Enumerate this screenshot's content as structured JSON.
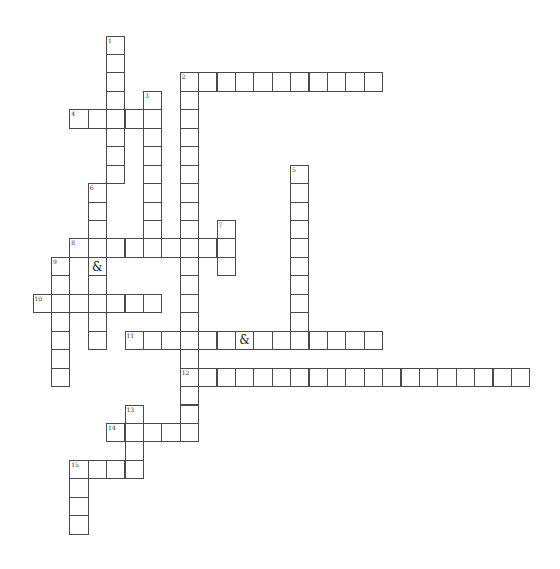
{
  "puzzle": {
    "type": "crossword",
    "grid_origin": {
      "x": 32.5,
      "y": 35.5
    },
    "cell_size": {
      "w": 18.4,
      "h": 18.45
    },
    "line_color": "#4a4a4a",
    "words": [
      {
        "number": "1",
        "direction": "down",
        "col": 4,
        "row": 0,
        "length": 8
      },
      {
        "number": "2",
        "direction": "across",
        "col": 8,
        "row": 2,
        "length": 11
      },
      {
        "number": "2",
        "direction": "down",
        "col": 8,
        "row": 2,
        "length": 20
      },
      {
        "number": "3",
        "direction": "down",
        "col": 6,
        "row": 3,
        "length": 9
      },
      {
        "number": "4",
        "direction": "across",
        "col": 2,
        "row": 4,
        "length": 5
      },
      {
        "number": "5",
        "direction": "down",
        "col": 14,
        "row": 7,
        "length": 10
      },
      {
        "number": "6",
        "direction": "down",
        "col": 3,
        "row": 8,
        "length": 9,
        "given": [
          {
            "index": 4,
            "char": "&"
          }
        ]
      },
      {
        "number": "7",
        "direction": "down",
        "col": 10,
        "row": 10,
        "length": 3
      },
      {
        "number": "8",
        "direction": "across",
        "col": 2,
        "row": 11,
        "length": 9
      },
      {
        "number": "9",
        "direction": "down",
        "col": 1,
        "row": 12,
        "length": 7
      },
      {
        "number": "10",
        "direction": "across",
        "col": 0,
        "row": 14,
        "length": 7
      },
      {
        "number": "11",
        "direction": "across",
        "col": 5,
        "row": 16,
        "length": 14,
        "given": [
          {
            "index": 6,
            "char": "&"
          }
        ]
      },
      {
        "number": "12",
        "direction": "across",
        "col": 8,
        "row": 18,
        "length": 19
      },
      {
        "number": "13",
        "direction": "down",
        "col": 5,
        "row": 20,
        "length": 4
      },
      {
        "number": "14",
        "direction": "across",
        "col": 4,
        "row": 21,
        "length": 5
      },
      {
        "number": "15",
        "direction": "across",
        "col": 2,
        "row": 23,
        "length": 4
      },
      {
        "number": "15",
        "direction": "down",
        "col": 2,
        "row": 23,
        "length": 4
      }
    ]
  }
}
